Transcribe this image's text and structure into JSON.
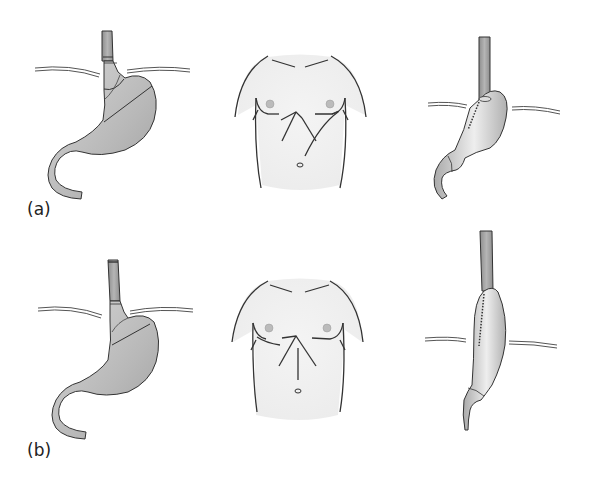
{
  "figure": {
    "panels": [
      {
        "id": "a",
        "label": "(a)",
        "views": [
          "stomach-before",
          "torso-incisions",
          "gastric-tube-after"
        ],
        "incision": "left-thoracoabdominal"
      },
      {
        "id": "b",
        "label": "(b)",
        "views": [
          "stomach-before",
          "torso-incisions",
          "gastric-tube-after"
        ],
        "incision": "midline-abdominal-and-right-thoracotomy"
      }
    ]
  },
  "colors": {
    "organ_fill_dark": "#9a9a9a",
    "organ_fill_light": "#dedede",
    "outline": "#333333",
    "torso_fill": "#f1f1f1",
    "diaphragm": "#555555",
    "background": "#ffffff"
  }
}
